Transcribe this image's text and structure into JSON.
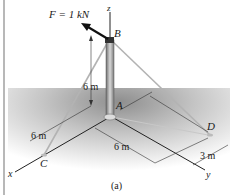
{
  "figure": {
    "caption": "(a)",
    "force_label": "F = 1 kN",
    "points": {
      "A": "A",
      "B": "B",
      "C": "C",
      "D": "D"
    },
    "axes": {
      "x": "x",
      "y": "y",
      "z": "z"
    },
    "dimensions": {
      "height_AB": "6 m",
      "x_to_C": "6 m",
      "y_to_D": "6 m",
      "offset_D": "3 m"
    },
    "colors": {
      "ground_shadow": "#9a9a9a",
      "pole": "#8c8c8c",
      "cables": "#b5b5b5",
      "force_arrow": "#111111",
      "axes": "#222222"
    }
  }
}
